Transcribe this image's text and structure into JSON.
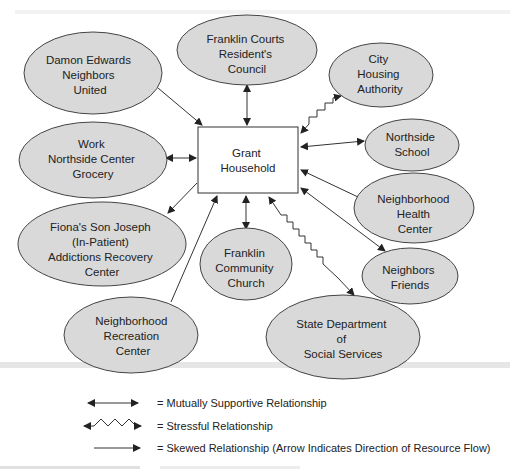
{
  "diagram": {
    "center": {
      "label_lines": [
        "Grant",
        "Household"
      ]
    },
    "nodes": [
      {
        "id": "damon",
        "label_lines": [
          "Damon Edwards",
          "Neighbors",
          "United"
        ]
      },
      {
        "id": "franklin_courts",
        "label_lines": [
          "Franklin Courts",
          "Resident's",
          "Council"
        ]
      },
      {
        "id": "city_housing",
        "label_lines": [
          "City",
          "Housing",
          "Authority"
        ]
      },
      {
        "id": "northside_school",
        "label_lines": [
          "Northside",
          "School"
        ]
      },
      {
        "id": "work",
        "label_lines": [
          "Work",
          "Northside Center",
          "Grocery"
        ]
      },
      {
        "id": "health_center",
        "label_lines": [
          "Neighborhood",
          "Health",
          "Center"
        ]
      },
      {
        "id": "fiona",
        "label_lines": [
          "Fiona's Son Joseph",
          "(In-Patient)",
          "Addictions Recovery",
          "Center"
        ]
      },
      {
        "id": "church",
        "label_lines": [
          "Franklin",
          "Community",
          "Church"
        ]
      },
      {
        "id": "neighbors_friends",
        "label_lines": [
          "Neighbors",
          "Friends"
        ]
      },
      {
        "id": "recreation",
        "label_lines": [
          "Neighborhood",
          "Recreation",
          "Center"
        ]
      },
      {
        "id": "state_dept",
        "label_lines": [
          "State Department",
          "of",
          "Social Services"
        ]
      }
    ],
    "edges": [
      {
        "from": "damon",
        "to": "center",
        "type": "skewed"
      },
      {
        "from": "franklin_courts",
        "to": "center",
        "type": "mutual"
      },
      {
        "from": "city_housing",
        "to": "center",
        "type": "stressful"
      },
      {
        "from": "northside_school",
        "to": "center",
        "type": "mutual"
      },
      {
        "from": "work",
        "to": "center",
        "type": "mutual"
      },
      {
        "from": "health_center",
        "to": "center",
        "type": "skewed"
      },
      {
        "from": "center",
        "to": "fiona",
        "type": "skewed"
      },
      {
        "from": "church",
        "to": "center",
        "type": "mutual"
      },
      {
        "from": "neighbors_friends",
        "to": "center",
        "type": "mutual"
      },
      {
        "from": "recreation",
        "to": "center",
        "type": "skewed"
      },
      {
        "from": "state_dept",
        "to": "center",
        "type": "stressful"
      }
    ]
  },
  "legend": {
    "mutual": "= Mutually Supportive Relationship",
    "stressful": "= Stressful Relationship",
    "skewed": "= Skewed Relationship (Arrow Indicates Direction of Resource Flow)"
  },
  "colors": {
    "node_fill": "#d9d9d9",
    "stroke": "#333333"
  }
}
